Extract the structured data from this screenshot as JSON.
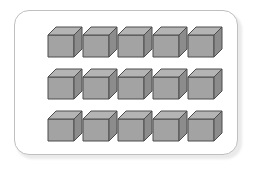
{
  "canvas": {
    "width": 253,
    "height": 169,
    "background": "#ffffff"
  },
  "panel": {
    "label": "cube-panel",
    "x": 14,
    "y": 10,
    "width": 224,
    "height": 145,
    "corner_radius": 15,
    "border_color": "#bfbfbf",
    "fill_color": "#ffffff",
    "shadow_color": "#d9d9d9"
  },
  "grid": {
    "label": "cube-grid",
    "rows": 3,
    "columns": 5,
    "total_cubes": 15,
    "origin_x": 48,
    "origin_y": 27,
    "column_step": 35,
    "row_step": 42,
    "cube_width": 34,
    "cube_height": 30
  },
  "cube_style": {
    "top_face_color": "#b4b4b4",
    "front_face_color": "#a3a3a3",
    "side_face_color": "#8c8c8c",
    "outline_color": "#4d4d4d",
    "outline_width": 1,
    "top_depth": 8,
    "side_depth": 8
  },
  "cubes": [
    {
      "id": "cube-r1-c1",
      "row": 1,
      "col": 1,
      "x": 48,
      "y": 27
    },
    {
      "id": "cube-r1-c2",
      "row": 1,
      "col": 2,
      "x": 83,
      "y": 27
    },
    {
      "id": "cube-r1-c3",
      "row": 1,
      "col": 3,
      "x": 118,
      "y": 27
    },
    {
      "id": "cube-r1-c4",
      "row": 1,
      "col": 4,
      "x": 153,
      "y": 27
    },
    {
      "id": "cube-r1-c5",
      "row": 1,
      "col": 5,
      "x": 188,
      "y": 27
    },
    {
      "id": "cube-r2-c1",
      "row": 2,
      "col": 1,
      "x": 48,
      "y": 69
    },
    {
      "id": "cube-r2-c2",
      "row": 2,
      "col": 2,
      "x": 83,
      "y": 69
    },
    {
      "id": "cube-r2-c3",
      "row": 2,
      "col": 3,
      "x": 118,
      "y": 69
    },
    {
      "id": "cube-r2-c4",
      "row": 2,
      "col": 4,
      "x": 153,
      "y": 69
    },
    {
      "id": "cube-r2-c5",
      "row": 2,
      "col": 5,
      "x": 188,
      "y": 69
    },
    {
      "id": "cube-r3-c1",
      "row": 3,
      "col": 1,
      "x": 48,
      "y": 111
    },
    {
      "id": "cube-r3-c2",
      "row": 3,
      "col": 2,
      "x": 83,
      "y": 111
    },
    {
      "id": "cube-r3-c3",
      "row": 3,
      "col": 3,
      "x": 118,
      "y": 111
    },
    {
      "id": "cube-r3-c4",
      "row": 3,
      "col": 4,
      "x": 153,
      "y": 111
    },
    {
      "id": "cube-r3-c5",
      "row": 3,
      "col": 5,
      "x": 188,
      "y": 111
    }
  ]
}
